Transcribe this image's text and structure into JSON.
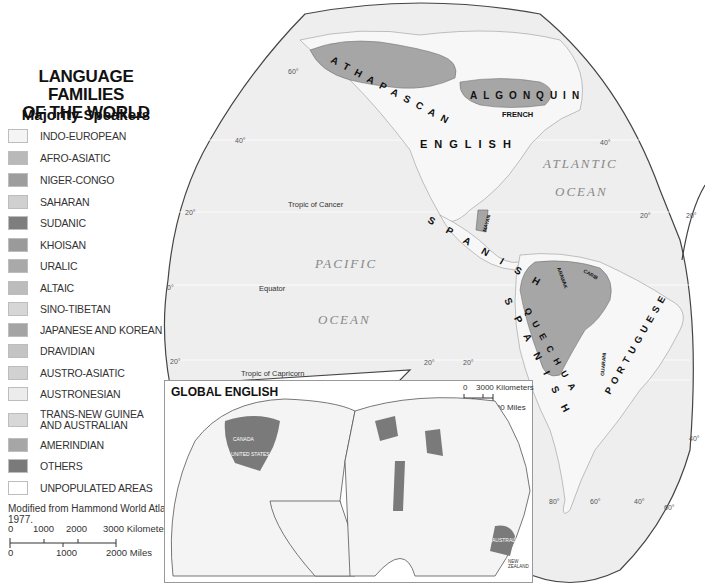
{
  "legend": {
    "title_line1": "LANGUAGE FAMILIES",
    "title_line2": "OF THE WORLD",
    "subtitle": "Majority Speakers",
    "items": [
      {
        "label": "INDO-EUROPEAN",
        "color": "#f4f4f4"
      },
      {
        "label": "AFRO-ASIATIC",
        "color": "#b9b9b9"
      },
      {
        "label": "NIGER-CONGO",
        "color": "#9d9d9d"
      },
      {
        "label": "SAHARAN",
        "color": "#d0d0d0"
      },
      {
        "label": "SUDANIC",
        "color": "#7e7e7e"
      },
      {
        "label": "KHOISAN",
        "color": "#9a9a9a"
      },
      {
        "label": "URALIC",
        "color": "#a9a9a9"
      },
      {
        "label": "ALTAIC",
        "color": "#bcbcbc"
      },
      {
        "label": "SINO-TIBETAN",
        "color": "#d6d6d6"
      },
      {
        "label": "JAPANESE AND KOREAN",
        "color": "#a4a4a4"
      },
      {
        "label": "DRAVIDIAN",
        "color": "#c4c4c4"
      },
      {
        "label": "AUSTRO-ASIATIC",
        "color": "#d1d1d1"
      },
      {
        "label": "AUSTRONESIAN",
        "color": "#ececec"
      },
      {
        "label": "TRANS-NEW GUINEA AND AUSTRALIAN",
        "color": "#d8d8d8"
      },
      {
        "label": "AMERINDIAN",
        "color": "#a6a6a6"
      },
      {
        "label": "OTHERS",
        "color": "#7a7a7a"
      },
      {
        "label": "UNPOPULATED AREAS",
        "color": "#ffffff"
      }
    ],
    "source": "Modified from Hammond World Atlas, 1977.",
    "scale": {
      "km_ticks": [
        "0",
        "1000",
        "2000",
        "3000 Kilometers"
      ],
      "mile_ticks": [
        "0",
        "1000",
        "2000 Miles"
      ]
    }
  },
  "map": {
    "labels": {
      "athapascan": "ATHAPASCAN",
      "algonquin": "ALGONQUIN",
      "french": "FRENCH",
      "english": "ENGLISH",
      "spanish": "SPANISH",
      "spanish_south": "SPANISH",
      "portuguese": "PORTUGUESE",
      "mayan": "MAYAN",
      "arawak": "ARAWAK",
      "carib": "CARIB",
      "quechua": "QUECHUA",
      "guarani": "GUARANI",
      "atlantic": "ATLANTIC",
      "atlantic_ocean": "OCEAN",
      "pacific": "PACIFIC",
      "pacific_ocean": "OCEAN",
      "tropic_cancer": "Tropic of Cancer",
      "equator": "Equator",
      "tropic_capricorn": "Tropic of Capricorn"
    },
    "graticule": {
      "lat_60_nw": "60°",
      "lat_40_w": "40°",
      "lat_20_w": "20°",
      "lat_0_w": "0°",
      "lat_20s_w": "20°",
      "lat_40_e": "40°",
      "lat_20_e": "20°",
      "lat_20_e2": "20°",
      "lat_20s_mid1": "20°",
      "lat_20s_mid2": "20°",
      "lat_40s_e": "40°",
      "lon_80": "80°",
      "lon_60": "60°",
      "lon_40": "40°",
      "lat_60s": "60°"
    },
    "colors": {
      "ocean": "#eeeeee",
      "land": "#f7f7f7",
      "amerindian": "#a6a6a6",
      "outline": "#444444"
    }
  },
  "inset": {
    "title": "GLOBAL ENGLISH",
    "scale": {
      "km": [
        "0",
        "3000 Kilometers"
      ],
      "miles": [
        "0",
        "2000 Miles"
      ]
    },
    "countries": [
      "CANADA",
      "UNITED STATES",
      "DOMINICAN REPUBLIC",
      "JAMAICA",
      "BELIZE",
      "PANAMA",
      "GUYANA",
      "ICELAND",
      "NORWAY",
      "SWEDEN",
      "FINLAND",
      "IRELAND",
      "NETH.",
      "GAMBIA",
      "SIERRA LEONE",
      "LIBERIA",
      "GHANA",
      "CAMEROON",
      "SOUTH SUDAN",
      "SOMALIA",
      "KENYA",
      "TANZANIA",
      "ZAMBIA",
      "BOTSWANA",
      "SWAZILAND",
      "LESOTHO",
      "SOUTH AFRICA",
      "INDIA",
      "SRI LANKA",
      "PHILIPPINES",
      "BRUNEI",
      "MALAYSIA",
      "PAPUA NEW GUINEA",
      "AUSTRALIA",
      "NEW ZEALAND"
    ]
  }
}
